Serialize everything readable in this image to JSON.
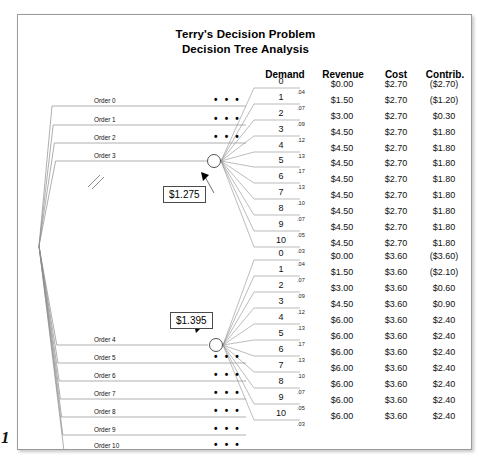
{
  "title": {
    "line1": "Terry's Decision Problem",
    "line2": "Decision Tree Analysis"
  },
  "page_number": "1",
  "columns": {
    "demand": "Demand",
    "revenue": "Revenue",
    "cost": "Cost",
    "contrib": "Contrib."
  },
  "value_boxes": {
    "upper": "$1.275",
    "lower": "$1.395"
  },
  "decision_branches": [
    {
      "label": "Order 0",
      "collapsed": true
    },
    {
      "label": "Order 1",
      "collapsed": true
    },
    {
      "label": "Order 2",
      "collapsed": true
    },
    {
      "label": "Order 3",
      "collapsed": false
    },
    {
      "label": "Order 4",
      "collapsed": false
    },
    {
      "label": "Order 5",
      "collapsed": true
    },
    {
      "label": "Order 6",
      "collapsed": true
    },
    {
      "label": "Order 7",
      "collapsed": true
    },
    {
      "label": "Order 8",
      "collapsed": true
    },
    {
      "label": "Order 9",
      "collapsed": true
    },
    {
      "label": "Order 10",
      "collapsed": true
    }
  ],
  "collapsed_marker": "• • •",
  "upper_branch": {
    "expected_value": "$1.275",
    "rows": [
      {
        "demand": "0",
        "prob": ".04",
        "revenue": "$0.00",
        "cost": "$2.70",
        "contrib": "($2.70)"
      },
      {
        "demand": "1",
        "prob": ".07",
        "revenue": "$1.50",
        "cost": "$2.70",
        "contrib": "($1.20)"
      },
      {
        "demand": "2",
        "prob": ".09",
        "revenue": "$3.00",
        "cost": "$2.70",
        "contrib": "$0.30"
      },
      {
        "demand": "3",
        "prob": ".12",
        "revenue": "$4.50",
        "cost": "$2.70",
        "contrib": "$1.80"
      },
      {
        "demand": "4",
        "prob": ".13",
        "revenue": "$4.50",
        "cost": "$2.70",
        "contrib": "$1.80"
      },
      {
        "demand": "5",
        "prob": ".17",
        "revenue": "$4.50",
        "cost": "$2.70",
        "contrib": "$1.80"
      },
      {
        "demand": "6",
        "prob": ".13",
        "revenue": "$4.50",
        "cost": "$2.70",
        "contrib": "$1.80"
      },
      {
        "demand": "7",
        "prob": ".10",
        "revenue": "$4.50",
        "cost": "$2.70",
        "contrib": "$1.80"
      },
      {
        "demand": "8",
        "prob": ".07",
        "revenue": "$4.50",
        "cost": "$2.70",
        "contrib": "$1.80"
      },
      {
        "demand": "9",
        "prob": ".05",
        "revenue": "$4.50",
        "cost": "$2.70",
        "contrib": "$1.80"
      },
      {
        "demand": "10",
        "prob": ".03",
        "revenue": "$4.50",
        "cost": "$2.70",
        "contrib": "$1.80"
      }
    ]
  },
  "lower_branch": {
    "expected_value": "$1.395",
    "rows": [
      {
        "demand": "0",
        "prob": ".04",
        "revenue": "$0.00",
        "cost": "$3.60",
        "contrib": "($3.60)"
      },
      {
        "demand": "1",
        "prob": ".07",
        "revenue": "$1.50",
        "cost": "$3.60",
        "contrib": "($2.10)"
      },
      {
        "demand": "2",
        "prob": ".09",
        "revenue": "$3.00",
        "cost": "$3.60",
        "contrib": "$0.60"
      },
      {
        "demand": "3",
        "prob": ".12",
        "revenue": "$4.50",
        "cost": "$3.60",
        "contrib": "$0.90"
      },
      {
        "demand": "4",
        "prob": ".13",
        "revenue": "$6.00",
        "cost": "$3.60",
        "contrib": "$2.40"
      },
      {
        "demand": "5",
        "prob": ".17",
        "revenue": "$6.00",
        "cost": "$3.60",
        "contrib": "$2.40"
      },
      {
        "demand": "6",
        "prob": ".13",
        "revenue": "$6.00",
        "cost": "$3.60",
        "contrib": "$2.40"
      },
      {
        "demand": "7",
        "prob": ".10",
        "revenue": "$6.00",
        "cost": "$3.60",
        "contrib": "$2.40"
      },
      {
        "demand": "8",
        "prob": ".07",
        "revenue": "$6.00",
        "cost": "$3.60",
        "contrib": "$2.40"
      },
      {
        "demand": "9",
        "prob": ".05",
        "revenue": "$6.00",
        "cost": "$3.60",
        "contrib": "$2.40"
      },
      {
        "demand": "10",
        "prob": ".03",
        "revenue": "$6.00",
        "cost": "$3.60",
        "contrib": "$2.40"
      }
    ]
  }
}
